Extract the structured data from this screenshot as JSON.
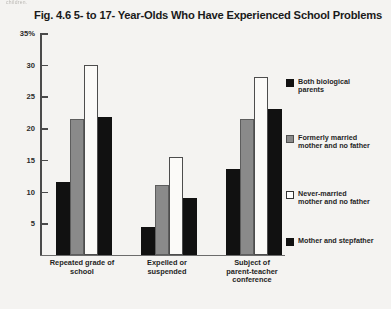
{
  "scan_artifact_text": "children.",
  "chart_data": {
    "type": "bar",
    "title": "Fig. 4.6  5- to 17- Year-Olds Who Have Experienced School Problems",
    "xlabel": "",
    "ylabel": "",
    "ylim": [
      0,
      35
    ],
    "grid": false,
    "legend_position": "right",
    "ytick_labels": [
      "35%",
      "30",
      "25",
      "20",
      "15",
      "10",
      "5"
    ],
    "ytick_values": [
      35,
      30,
      25,
      20,
      15,
      10,
      5
    ],
    "categories": [
      "Repeated grade of\nschool",
      "Expelled or\nsuspended",
      "Subject of\nparent-teacher\nconference"
    ],
    "series": [
      {
        "name": "Both biological\nparents",
        "swatch_color": "#111111",
        "values": [
          11.5,
          4.5,
          13.5
        ]
      },
      {
        "name": "Formerly married\nmother and no father",
        "swatch_color": "#8a8a8a",
        "values": [
          21.5,
          11,
          21.5
        ]
      },
      {
        "name": "Never-married\nmother and no father",
        "swatch_color": "#ffffff",
        "values": [
          30,
          15.5,
          28
        ]
      },
      {
        "name": "Mother and stepfather",
        "swatch_color": "#111111",
        "values": [
          21.8,
          9,
          23
        ]
      }
    ]
  }
}
